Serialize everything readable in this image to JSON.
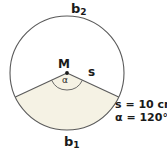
{
  "figure": {
    "name": "circle-sector-diagram",
    "background_color": "#ffffff",
    "stroke_color": "#4d4d4d",
    "sector_fill_color": "#f5f2e4",
    "text_color": "#1a1a1a"
  },
  "labels": {
    "arc_upper": "b",
    "arc_upper_sub": "2",
    "arc_lower": "b",
    "arc_lower_sub": "1",
    "center": "M",
    "radius": "s",
    "angle": "α"
  },
  "values": {
    "arc_length": "s = 10 cm",
    "angle": "α = 120°"
  },
  "geometry": {
    "center_x": 67,
    "center_y": 73,
    "radius": 57,
    "sector_start_angle_deg": 155,
    "sector_end_angle_deg": 25,
    "sector_sweep_deg": 120,
    "angle_arc_radius": 17
  }
}
